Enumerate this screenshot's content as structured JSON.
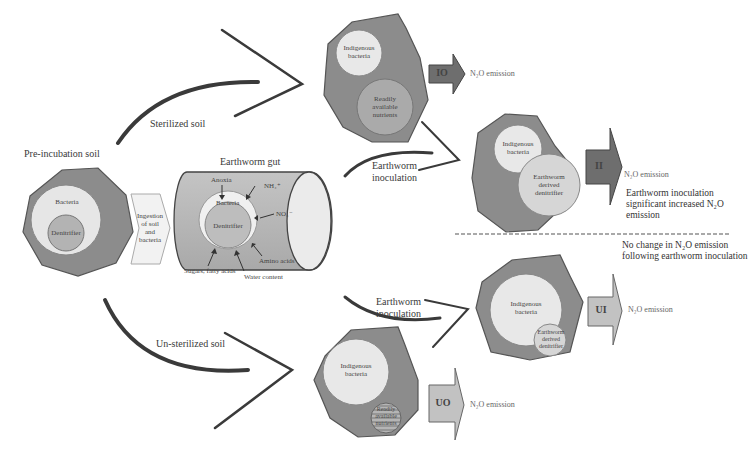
{
  "colors": {
    "soil_particle": "#8c8c8c",
    "soil_outline": "#555555",
    "bacteria_circle": "#e8e8e8",
    "nutrient_circle": "#b0b0b0",
    "gut_body": "#b8b8b8",
    "arrow_dark": "#3a3a3a",
    "box_dark": "#6e6e6e",
    "box_light": "#bdbdbd"
  },
  "pre_incubation": {
    "label": "Pre-incubation soil",
    "bacteria": "Bacteria",
    "denitrifier": "Denitrifier"
  },
  "ingestion": {
    "line1": "Ingestion",
    "line2": "of soil",
    "line3": "and",
    "line4": "bacteria"
  },
  "gut": {
    "title": "Earthworm gut",
    "bacteria": "Bacteria",
    "denitrifier": "Denitrifier",
    "factors": {
      "anoxia": "Anoxia",
      "nh4": "NH₄⁺",
      "no3": "NO₃⁻",
      "amino_acids": "Amino acids",
      "water_content": "Water content",
      "sugars": "Sugars, fatty acids"
    }
  },
  "paths": {
    "sterilized": "Sterilized soil",
    "unsterilized": "Un-sterilized soil",
    "inoculation_top": [
      "Earthworm",
      "inoculation"
    ],
    "inoculation_bottom": [
      "Earthworm",
      "inoculation"
    ]
  },
  "top_panel": {
    "io": {
      "box": "IO",
      "indigenous": [
        "Indigenous",
        "bacteria"
      ],
      "nutrients": [
        "Readily",
        "available",
        "nutrients"
      ],
      "emission": "N₂O emission"
    },
    "ii": {
      "box": "II",
      "indigenous": [
        "Indigenous",
        "bacteria"
      ],
      "derived": [
        "Earthworm",
        "derived",
        "denitrifier"
      ],
      "emission": "N₂O emission"
    },
    "conclusion": "Earthworm inoculation significant increased N₂O emission"
  },
  "bottom_panel": {
    "conclusion": "No change in N₂O emission following earthworm inoculation",
    "ui": {
      "box": "UI",
      "indigenous": [
        "Indigenous",
        "bacteria"
      ],
      "derived": [
        "Earthworm",
        "derived",
        "denitrifier"
      ],
      "emission": "N₂O emission"
    },
    "uo": {
      "box": "UO",
      "indigenous": [
        "Indigenous",
        "bacteria"
      ],
      "nutrients": [
        "Readily",
        "available",
        "nutrients"
      ],
      "emission": "N₂O emission"
    }
  }
}
